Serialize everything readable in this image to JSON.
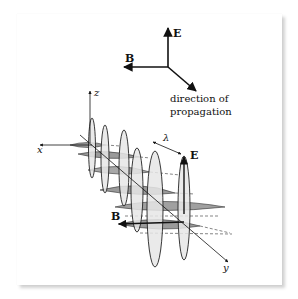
{
  "figure": {
    "triad": {
      "e_label": "E",
      "b_label": "B",
      "propagation_line1": "direction of",
      "propagation_line2": "propagation"
    },
    "axes": {
      "z_label": "z",
      "x_label": "x",
      "y_label": "y"
    },
    "wave": {
      "wavelength_label": "λ",
      "e_label": "E",
      "b_label": "B",
      "e_fill": "#e6e6e6",
      "b_fill": "#9a9a9a",
      "stroke": "#222222"
    }
  }
}
